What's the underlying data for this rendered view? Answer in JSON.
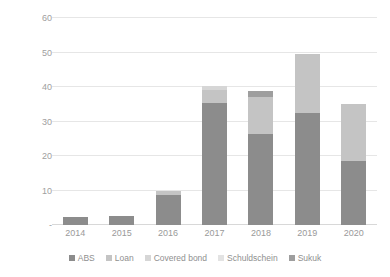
{
  "chart_data": {
    "type": "bar",
    "title": "",
    "subtitle": "",
    "xlabel": "",
    "ylabel": "USD Billions",
    "stacked": true,
    "grid": true,
    "legend_position": "bottom",
    "ylim": [
      0,
      60
    ],
    "yticks": [
      0,
      10,
      20,
      30,
      40,
      50,
      60
    ],
    "ytick_labels": [
      "-",
      "10",
      "20",
      "30",
      "40",
      "50",
      "60"
    ],
    "categories": [
      "2014",
      "2015",
      "2016",
      "2017",
      "2018",
      "2019",
      "2020"
    ],
    "series": [
      {
        "name": "ABS",
        "color": "#8c8c8c",
        "values": [
          2.3,
          2.6,
          8.8,
          35.5,
          26.3,
          32.5,
          18.7
        ]
      },
      {
        "name": "Loan",
        "color": "#c4c4c4",
        "values": [
          0,
          0,
          1.2,
          3.5,
          10.7,
          17.0,
          16.3
        ]
      },
      {
        "name": "Covered bond",
        "color": "#d6d6d6",
        "values": [
          0,
          0,
          0,
          1.3,
          0,
          0,
          0
        ]
      },
      {
        "name": "Schuldschein",
        "color": "#e3e3e3",
        "values": [
          0,
          0,
          0,
          0,
          0,
          0,
          0
        ]
      },
      {
        "name": "Sukuk",
        "color": "#9e9e9e",
        "values": [
          0,
          0,
          0,
          0,
          1.8,
          0,
          0
        ]
      }
    ],
    "totals": [
      2.3,
      2.6,
      10.0,
      40.3,
      38.8,
      49.5,
      35.0
    ]
  },
  "colors": {
    "gridline": "#e6e6e6",
    "baseline": "#d8d8d8",
    "tick_text": "#a0a0a0",
    "axis_title": "#8d8d8d",
    "legend_text": "#8f8f8f",
    "background": "#ffffff"
  }
}
